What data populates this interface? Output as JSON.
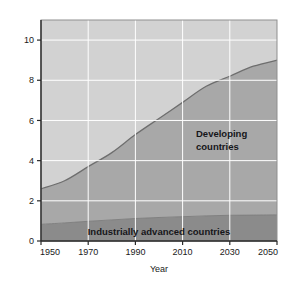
{
  "chart_data": {
    "type": "area",
    "title": "",
    "subtitle": "",
    "xlabel": "Year",
    "ylabel": "Population (billions)",
    "xlim": [
      1950,
      2050
    ],
    "ylim": [
      0,
      11
    ],
    "xticks": [
      1950,
      1970,
      1990,
      2010,
      2030,
      2050
    ],
    "xtick_labels": [
      "1950",
      "1970",
      "1990",
      "2010",
      "2030",
      "2050"
    ],
    "yticks": [
      0,
      2,
      4,
      6,
      8,
      10
    ],
    "ytick_labels": [
      "0",
      "2",
      "4",
      "6",
      "8",
      "10"
    ],
    "grid": true,
    "grid_color": "#ffffff",
    "legend_position": "inline-annotations",
    "stacked": true,
    "x": [
      1950,
      1960,
      1970,
      1980,
      1990,
      2000,
      2010,
      2020,
      2030,
      2040,
      2050
    ],
    "series": [
      {
        "name": "Industrially advanced countries",
        "color": "#8b8b8b",
        "values": [
          0.83,
          0.9,
          0.98,
          1.05,
          1.12,
          1.17,
          1.21,
          1.25,
          1.28,
          1.29,
          1.3
        ]
      },
      {
        "name": "Developing countries",
        "color": "#a8a8a8",
        "values": [
          1.77,
          2.1,
          2.72,
          3.35,
          4.18,
          4.93,
          5.69,
          6.45,
          6.92,
          7.41,
          7.7
        ]
      }
    ],
    "total": [
      2.6,
      3.0,
      3.7,
      4.4,
      5.3,
      6.1,
      6.9,
      7.7,
      8.2,
      8.7,
      9.0
    ],
    "annotations": [
      {
        "name": "developing-countries-label",
        "text_lines": [
          "Developing",
          "countries"
        ],
        "x": 2020,
        "y": 4.6
      },
      {
        "name": "industrially-advanced-countries-label",
        "text_lines": [
          "Industrially advanced countries"
        ],
        "x": 1998,
        "y": 0.45
      }
    ],
    "plot_background": "#d2d2d2",
    "axis_color": "#2a2a2a"
  },
  "axes": {
    "y_title": "Population (billions)",
    "x_title": "Year",
    "y_labels": [
      "10",
      "8",
      "6",
      "4",
      "2",
      "0"
    ],
    "x_labels": [
      "1950",
      "1970",
      "1990",
      "2010",
      "2030",
      "2050"
    ]
  },
  "labels": {
    "developing_line1": "Developing",
    "developing_line2": "countries",
    "advanced": "Industrially advanced countries"
  },
  "colors": {
    "upper_band": "#a8a8a8",
    "lower_band": "#8b8b8b",
    "background_band": "#d2d2d2",
    "grid": "#ffffff",
    "curve_stroke": "#6e6e6e",
    "text": "#1a1a1a"
  }
}
